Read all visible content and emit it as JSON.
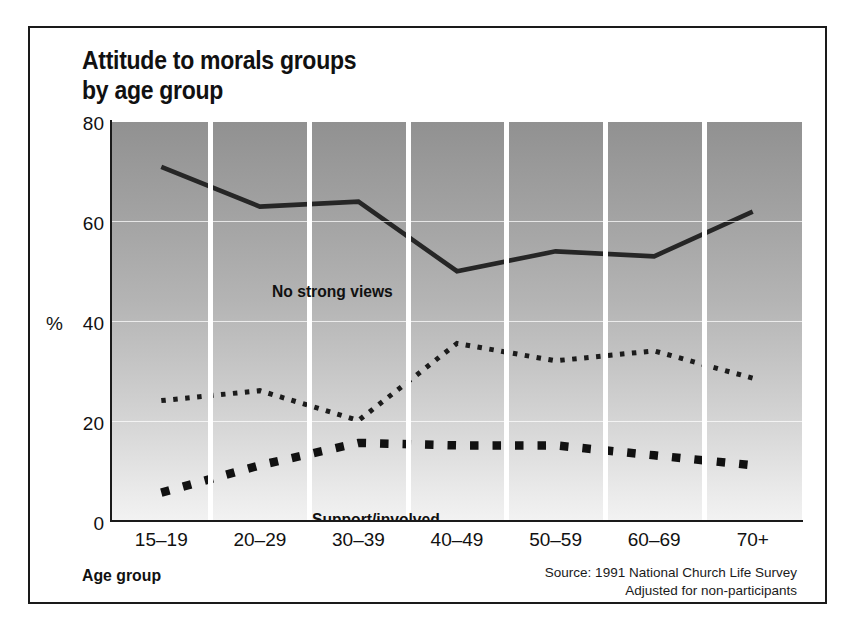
{
  "figure": {
    "title": "Attitude to morals groups\nby age group",
    "xaxis_title": "Age group",
    "percent_symbol": "%",
    "source": "Source: 1991 National Church Life Survey\nAdjusted for non-participants"
  },
  "labels": {
    "no_strong_views": "No strong views",
    "support_involved": "Support/involved",
    "groups_misguided": "Groups misguided"
  },
  "colors": {
    "line": "#262626",
    "axis": "#1a1a1a",
    "gridline": "#ffffff",
    "panel_top": "#919191",
    "panel_bottom": "#f2f2f2",
    "text": "#111111"
  },
  "chart_data": {
    "type": "line",
    "title": "Attitude to morals groups by age group",
    "xlabel": "Age group",
    "ylabel": "%",
    "ylim": [
      0,
      80
    ],
    "yticks": [
      0,
      20,
      40,
      60,
      80
    ],
    "grid": true,
    "legend": "inline-annotations",
    "categories": [
      "15–19",
      "20–29",
      "30–39",
      "40–49",
      "50–59",
      "60–69",
      "70+"
    ],
    "series": [
      {
        "name": "No strong views",
        "style": "solid",
        "values": [
          71,
          63,
          64,
          50,
          54,
          53,
          62
        ]
      },
      {
        "name": "Support/involved",
        "style": "fine-dotted",
        "values": [
          24,
          26,
          20,
          35.5,
          32,
          34,
          28.5
        ]
      },
      {
        "name": "Groups misguided",
        "style": "square-dashed",
        "values": [
          5.5,
          11,
          15.5,
          15,
          15,
          13,
          11
        ]
      }
    ]
  }
}
